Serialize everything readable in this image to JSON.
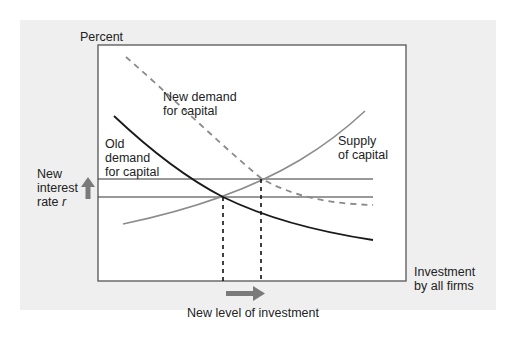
{
  "diagram": {
    "y_axis_label": "Percent",
    "x_axis_label_line1": "Investment",
    "x_axis_label_line2": "by all firms",
    "curves": {
      "new_demand_line1": "New demand",
      "new_demand_line2": "for capital",
      "old_demand_line1": "Old",
      "old_demand_line2": "demand",
      "old_demand_line3": "for capital",
      "supply_line1": "Supply",
      "supply_line2": "of capital"
    },
    "interest_label_line1": "New",
    "interest_label_line2": "interest",
    "interest_label_line3": "rate",
    "interest_symbol": "r",
    "investment_label": "New level of investment",
    "colors": {
      "panel": "#efefef",
      "plot_bg": "#ffffff",
      "old_demand": "#1a1a1a",
      "new_demand": "#8a8a8a",
      "supply": "#8c8c8c",
      "arrow": "#7a7a7a",
      "axis": "#555555"
    }
  }
}
